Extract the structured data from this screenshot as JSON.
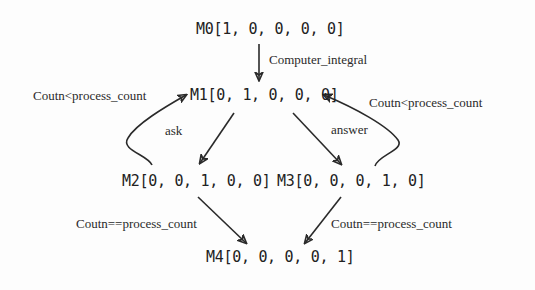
{
  "diagram": {
    "nodes": [
      {
        "id": "M0",
        "text": "M0[1, 0, 0, 0, 0]"
      },
      {
        "id": "M1",
        "text": "M1[0, 1, 0, 0, 0]"
      },
      {
        "id": "M2",
        "text": "M2[0, 0, 1, 0, 0]"
      },
      {
        "id": "M3",
        "text": "M3[0, 0, 0, 1, 0]"
      },
      {
        "id": "M4",
        "text": "M4[0, 0, 0, 0, 1]"
      }
    ],
    "edges": [
      {
        "from": "M0",
        "to": "M1",
        "label": "Computer_integral"
      },
      {
        "from": "M1",
        "to": "M2",
        "label": "ask"
      },
      {
        "from": "M1",
        "to": "M3",
        "label": "answer"
      },
      {
        "from": "M2",
        "to": "M1",
        "label": "Coutn<process_count"
      },
      {
        "from": "M3",
        "to": "M1",
        "label": "Coutn<process_count"
      },
      {
        "from": "M2",
        "to": "M4",
        "label": "Coutn==process_count"
      },
      {
        "from": "M3",
        "to": "M4",
        "label": "Coutn==process_count"
      }
    ]
  }
}
